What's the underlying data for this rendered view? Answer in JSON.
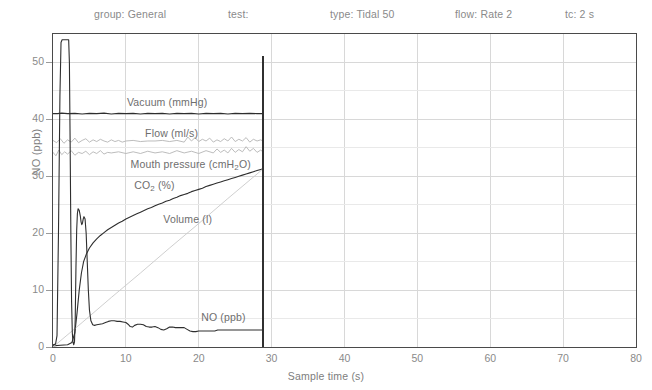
{
  "header": {
    "items": [
      {
        "label": "group: General",
        "x": 94
      },
      {
        "label": "test:",
        "x": 228
      },
      {
        "label": "type: Tidal 50",
        "x": 330
      },
      {
        "label": "flow: Rate 2",
        "x": 455
      },
      {
        "label": "tc: 2 s",
        "x": 565
      }
    ]
  },
  "colors": {
    "frame": "#4a4a4a",
    "grid": "#d8d8d8",
    "axis_text": "#8a8a8a",
    "series_label": "#6e6e6e",
    "dark_trace": "#2e2e2e",
    "light_trace": "#b4b4b4",
    "volume_trace": "#c9c9c9",
    "cursor": "#303030",
    "background": "#ffffff"
  },
  "chart_data": {
    "type": "line",
    "title": "",
    "xlabel": "Sample time (s)",
    "ylabel": "NO (ppb)",
    "xlim": [
      0,
      80
    ],
    "ylim": [
      0,
      55
    ],
    "xticks": [
      0,
      10,
      20,
      30,
      40,
      50,
      60,
      70,
      80
    ],
    "yticks": [
      0,
      10,
      20,
      30,
      40,
      50
    ],
    "grid": true,
    "legend": "inline-annotations",
    "cursor_time_s": 28.8,
    "data_end_time_s": 28.8,
    "series": [
      {
        "name": "Vacuum (mmHg)",
        "label_x_s": 10.0,
        "label_y": 43.0,
        "style": "dark",
        "points": [
          [
            0.0,
            41.0
          ],
          [
            0.6,
            41.0
          ],
          [
            1.2,
            41.1
          ],
          [
            2.0,
            41.0
          ],
          [
            3.0,
            41.05
          ],
          [
            4.0,
            40.95
          ],
          [
            5.0,
            41.05
          ],
          [
            6.0,
            41.0
          ],
          [
            7.0,
            41.1
          ],
          [
            8.0,
            40.95
          ],
          [
            9.0,
            41.05
          ],
          [
            10.0,
            41.0
          ],
          [
            11.0,
            41.05
          ],
          [
            12.0,
            40.95
          ],
          [
            13.0,
            41.05
          ],
          [
            14.0,
            41.0
          ],
          [
            15.0,
            41.05
          ],
          [
            16.0,
            40.95
          ],
          [
            17.0,
            41.05
          ],
          [
            18.0,
            41.0
          ],
          [
            19.0,
            41.05
          ],
          [
            20.0,
            40.95
          ],
          [
            21.0,
            41.05
          ],
          [
            22.0,
            41.0
          ],
          [
            23.0,
            41.05
          ],
          [
            24.0,
            40.95
          ],
          [
            25.0,
            41.05
          ],
          [
            26.0,
            41.0
          ],
          [
            27.0,
            41.05
          ],
          [
            28.0,
            41.0
          ],
          [
            28.8,
            41.0
          ]
        ]
      },
      {
        "name": "Flow (ml/s)",
        "label_x_s": 12.5,
        "label_y": 37.6,
        "style": "light",
        "points": [
          [
            0.0,
            36.3
          ],
          [
            0.5,
            35.9
          ],
          [
            1.0,
            36.6
          ],
          [
            1.5,
            35.8
          ],
          [
            2.0,
            36.4
          ],
          [
            2.5,
            36.0
          ],
          [
            3.0,
            36.7
          ],
          [
            3.5,
            35.9
          ],
          [
            4.0,
            36.3
          ],
          [
            4.5,
            36.6
          ],
          [
            5.0,
            36.0
          ],
          [
            5.5,
            36.4
          ],
          [
            6.0,
            36.1
          ],
          [
            6.5,
            36.5
          ],
          [
            7.0,
            36.2
          ],
          [
            7.5,
            36.0
          ],
          [
            8.0,
            36.4
          ],
          [
            8.5,
            36.1
          ],
          [
            9.0,
            36.3
          ],
          [
            9.5,
            36.0
          ],
          [
            10.0,
            36.2
          ],
          [
            11.0,
            36.3
          ],
          [
            12.0,
            36.1
          ],
          [
            13.0,
            36.2
          ],
          [
            14.0,
            36.2
          ],
          [
            15.0,
            36.3
          ],
          [
            16.0,
            36.1
          ],
          [
            17.0,
            36.3
          ],
          [
            18.0,
            36.0
          ],
          [
            18.5,
            36.9
          ],
          [
            19.0,
            36.2
          ],
          [
            19.5,
            36.8
          ],
          [
            20.0,
            36.1
          ],
          [
            20.5,
            36.5
          ],
          [
            21.0,
            36.2
          ],
          [
            21.5,
            36.7
          ],
          [
            22.0,
            36.0
          ],
          [
            22.5,
            36.4
          ],
          [
            23.0,
            36.1
          ],
          [
            23.5,
            36.6
          ],
          [
            24.0,
            36.2
          ],
          [
            24.5,
            36.9
          ],
          [
            25.0,
            36.1
          ],
          [
            25.5,
            36.5
          ],
          [
            26.0,
            36.2
          ],
          [
            26.5,
            36.8
          ],
          [
            27.0,
            36.0
          ],
          [
            27.5,
            36.5
          ],
          [
            28.0,
            36.2
          ],
          [
            28.5,
            36.4
          ],
          [
            28.8,
            36.2
          ]
        ]
      },
      {
        "name": "Mouth pressure (cmH2O)",
        "label_x_s": 10.5,
        "label_y": 32.2,
        "style": "light",
        "points": [
          [
            0.0,
            34.2
          ],
          [
            0.4,
            33.6
          ],
          [
            0.8,
            34.6
          ],
          [
            1.2,
            33.8
          ],
          [
            1.6,
            34.3
          ],
          [
            2.0,
            33.9
          ],
          [
            2.5,
            34.5
          ],
          [
            3.0,
            33.7
          ],
          [
            3.5,
            34.2
          ],
          [
            4.0,
            34.0
          ],
          [
            4.5,
            34.4
          ],
          [
            5.0,
            33.8
          ],
          [
            5.5,
            34.3
          ],
          [
            6.0,
            34.0
          ],
          [
            6.5,
            34.5
          ],
          [
            7.0,
            33.9
          ],
          [
            7.5,
            34.2
          ],
          [
            8.0,
            34.1
          ],
          [
            9.0,
            34.3
          ],
          [
            10.0,
            34.0
          ],
          [
            11.0,
            34.3
          ],
          [
            12.0,
            34.0
          ],
          [
            13.0,
            34.4
          ],
          [
            14.0,
            34.1
          ],
          [
            15.0,
            34.3
          ],
          [
            16.0,
            34.0
          ],
          [
            17.0,
            34.5
          ],
          [
            18.0,
            34.1
          ],
          [
            19.0,
            34.4
          ],
          [
            20.0,
            34.0
          ],
          [
            21.0,
            34.5
          ],
          [
            22.0,
            34.1
          ],
          [
            22.5,
            34.8
          ],
          [
            23.0,
            34.2
          ],
          [
            23.5,
            34.6
          ],
          [
            24.0,
            34.1
          ],
          [
            24.5,
            34.9
          ],
          [
            25.0,
            34.2
          ],
          [
            25.5,
            34.7
          ],
          [
            26.0,
            34.3
          ],
          [
            26.5,
            35.2
          ],
          [
            27.0,
            34.4
          ],
          [
            27.5,
            34.9
          ],
          [
            28.0,
            34.2
          ],
          [
            28.5,
            34.6
          ],
          [
            28.8,
            34.3
          ]
        ]
      },
      {
        "name": "CO2 (%)",
        "label_x_s": 11.0,
        "label_y": 28.5,
        "style": "dark",
        "points": [
          [
            0.0,
            0.2
          ],
          [
            1.0,
            0.3
          ],
          [
            2.0,
            0.4
          ],
          [
            2.6,
            0.8
          ],
          [
            3.0,
            2.5
          ],
          [
            3.3,
            6.0
          ],
          [
            3.6,
            10.0
          ],
          [
            3.9,
            13.0
          ],
          [
            4.2,
            15.0
          ],
          [
            4.6,
            16.4
          ],
          [
            5.0,
            17.4
          ],
          [
            5.5,
            18.3
          ],
          [
            6.0,
            19.0
          ],
          [
            6.5,
            19.6
          ],
          [
            7.0,
            20.1
          ],
          [
            7.5,
            20.6
          ],
          [
            8.0,
            21.0
          ],
          [
            8.5,
            21.4
          ],
          [
            9.0,
            21.8
          ],
          [
            9.5,
            22.1
          ],
          [
            10.0,
            22.5
          ],
          [
            10.5,
            22.8
          ],
          [
            11.0,
            23.1
          ],
          [
            11.5,
            23.4
          ],
          [
            12.0,
            23.7
          ],
          [
            12.5,
            24.0
          ],
          [
            13.0,
            24.3
          ],
          [
            13.5,
            24.5
          ],
          [
            14.0,
            24.8
          ],
          [
            14.5,
            25.1
          ],
          [
            15.0,
            25.3
          ],
          [
            15.5,
            25.6
          ],
          [
            16.0,
            25.8
          ],
          [
            16.5,
            26.1
          ],
          [
            17.0,
            26.3
          ],
          [
            17.5,
            26.6
          ],
          [
            18.0,
            26.8
          ],
          [
            18.5,
            27.0
          ],
          [
            19.0,
            27.3
          ],
          [
            19.5,
            27.5
          ],
          [
            20.0,
            27.7
          ],
          [
            20.5,
            27.9
          ],
          [
            21.0,
            28.2
          ],
          [
            21.5,
            28.4
          ],
          [
            22.0,
            28.6
          ],
          [
            22.5,
            28.8
          ],
          [
            23.0,
            29.0
          ],
          [
            23.5,
            29.2
          ],
          [
            24.0,
            29.4
          ],
          [
            24.5,
            29.6
          ],
          [
            25.0,
            29.8
          ],
          [
            25.5,
            30.0
          ],
          [
            26.0,
            30.2
          ],
          [
            26.5,
            30.4
          ],
          [
            27.0,
            30.6
          ],
          [
            27.5,
            30.8
          ],
          [
            28.0,
            31.0
          ],
          [
            28.5,
            31.2
          ],
          [
            28.8,
            31.3
          ]
        ]
      },
      {
        "name": "Volume (l)",
        "label_x_s": 15.0,
        "label_y": 22.5,
        "style": "volume",
        "points": [
          [
            0.0,
            0.0
          ],
          [
            4.0,
            4.3
          ],
          [
            8.0,
            8.7
          ],
          [
            12.0,
            13.0
          ],
          [
            16.0,
            17.4
          ],
          [
            20.0,
            21.7
          ],
          [
            24.0,
            26.1
          ],
          [
            28.0,
            30.4
          ],
          [
            28.8,
            31.3
          ]
        ]
      },
      {
        "name": "NO (ppb)",
        "label_x_s": 20.2,
        "label_y": 5.2,
        "style": "dark",
        "points": [
          [
            0.0,
            0.4
          ],
          [
            0.35,
            0.5
          ],
          [
            0.55,
            2.0
          ],
          [
            0.75,
            20.0
          ],
          [
            0.95,
            44.0
          ],
          [
            1.1,
            53.5
          ],
          [
            1.25,
            54.0
          ],
          [
            1.45,
            54.0
          ],
          [
            1.65,
            54.0
          ],
          [
            1.85,
            54.0
          ],
          [
            2.0,
            54.0
          ],
          [
            2.15,
            54.0
          ],
          [
            2.25,
            50.0
          ],
          [
            2.35,
            36.0
          ],
          [
            2.45,
            20.0
          ],
          [
            2.55,
            8.0
          ],
          [
            2.65,
            2.5
          ],
          [
            2.75,
            0.8
          ],
          [
            2.85,
            0.4
          ],
          [
            2.95,
            0.9
          ],
          [
            3.05,
            5.0
          ],
          [
            3.15,
            14.0
          ],
          [
            3.25,
            20.5
          ],
          [
            3.35,
            23.5
          ],
          [
            3.45,
            24.3
          ],
          [
            3.6,
            24.0
          ],
          [
            3.75,
            23.0
          ],
          [
            3.85,
            22.0
          ],
          [
            3.95,
            21.5
          ],
          [
            4.05,
            21.8
          ],
          [
            4.15,
            22.5
          ],
          [
            4.25,
            22.9
          ],
          [
            4.4,
            22.5
          ],
          [
            4.55,
            20.0
          ],
          [
            4.7,
            15.0
          ],
          [
            4.85,
            10.0
          ],
          [
            5.0,
            6.5
          ],
          [
            5.2,
            4.6
          ],
          [
            5.45,
            3.9
          ],
          [
            5.7,
            3.8
          ],
          [
            6.0,
            3.9
          ],
          [
            6.4,
            4.0
          ],
          [
            6.8,
            4.1
          ],
          [
            7.2,
            4.3
          ],
          [
            7.6,
            4.5
          ],
          [
            8.0,
            4.6
          ],
          [
            8.4,
            4.6
          ],
          [
            8.8,
            4.5
          ],
          [
            9.2,
            4.5
          ],
          [
            9.6,
            4.4
          ],
          [
            10.0,
            4.3
          ],
          [
            10.3,
            4.0
          ],
          [
            10.6,
            3.6
          ],
          [
            10.9,
            3.5
          ],
          [
            11.2,
            3.8
          ],
          [
            11.6,
            4.0
          ],
          [
            12.0,
            4.0
          ],
          [
            12.4,
            3.9
          ],
          [
            12.8,
            3.6
          ],
          [
            13.2,
            3.5
          ],
          [
            13.6,
            3.5
          ],
          [
            14.0,
            3.6
          ],
          [
            14.4,
            3.4
          ],
          [
            14.8,
            3.1
          ],
          [
            15.2,
            3.0
          ],
          [
            15.6,
            3.2
          ],
          [
            16.0,
            3.5
          ],
          [
            16.4,
            3.5
          ],
          [
            16.8,
            3.4
          ],
          [
            17.2,
            3.4
          ],
          [
            17.6,
            3.4
          ],
          [
            18.0,
            3.4
          ],
          [
            18.4,
            3.1
          ],
          [
            18.8,
            2.8
          ],
          [
            19.2,
            2.7
          ],
          [
            19.6,
            2.7
          ],
          [
            20.0,
            2.8
          ],
          [
            20.6,
            2.8
          ],
          [
            21.2,
            2.8
          ],
          [
            21.8,
            2.8
          ],
          [
            22.2,
            2.8
          ],
          [
            22.6,
            3.0
          ],
          [
            23.0,
            3.0
          ],
          [
            24.0,
            3.0
          ],
          [
            25.0,
            3.0
          ],
          [
            26.0,
            3.0
          ],
          [
            27.0,
            3.0
          ],
          [
            28.0,
            3.0
          ],
          [
            28.8,
            3.0
          ]
        ]
      }
    ]
  }
}
